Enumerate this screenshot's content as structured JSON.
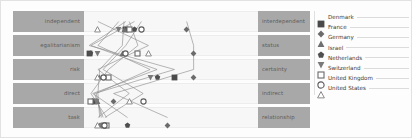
{
  "chart_data": {
    "type": "line",
    "title": "",
    "subtitle": "",
    "xlabel": "",
    "ylabel": "",
    "grid": true,
    "legend_position": "right",
    "xlim": [
      0,
      100
    ],
    "dimensions": [
      {
        "left": "independent",
        "right": "interdependent"
      },
      {
        "left": "egalitarianism",
        "right": "status"
      },
      {
        "left": "risk",
        "right": "certainty"
      },
      {
        "left": "direct",
        "right": "indirect"
      },
      {
        "left": "task",
        "right": "relationship"
      }
    ],
    "categories": [
      "independent",
      "egalitarianism",
      "risk",
      "direct",
      "task"
    ],
    "series": [
      {
        "name": "Denmark",
        "marker": "filled-square",
        "color": "#4a4a4a",
        "values": [
          24,
          3,
          52,
          6,
          11
        ]
      },
      {
        "name": "France",
        "marker": "filled-diamond",
        "color": "#6b6b6b",
        "values": [
          59,
          63,
          63,
          17,
          48
        ]
      },
      {
        "name": "Germany",
        "marker": "filled-triangle",
        "color": "#6f6f6f",
        "values": [
          23,
          22,
          9,
          8,
          9
        ]
      },
      {
        "name": "Israel",
        "marker": "filled-pentagon",
        "color": "#4f4f4f",
        "values": [
          29,
          4,
          42,
          5,
          25
        ]
      },
      {
        "name": "Netherlands",
        "marker": "filled-downtri",
        "color": "#7a7a7a",
        "values": [
          20,
          8,
          38,
          7,
          10
        ]
      },
      {
        "name": "Switzerland",
        "marker": "open-square",
        "color": "#6a6a6a",
        "values": [
          26,
          31,
          14,
          4,
          13
        ]
      },
      {
        "name": "United Kingdom",
        "marker": "open-circle",
        "color": "#5a5a5a",
        "values": [
          33,
          24,
          11,
          34,
          12
        ]
      },
      {
        "name": "United States",
        "marker": "open-triangle",
        "color": "#8a8a8a",
        "values": [
          8,
          37,
          8,
          26,
          8
        ]
      }
    ],
    "axis_band_color": "#a8a8a8",
    "plot_band_color": "#f7f7f7",
    "line_color": "#8d8d8d"
  },
  "legend": {
    "items": [
      {
        "label": "Denmark"
      },
      {
        "label": "France"
      },
      {
        "label": "Germany"
      },
      {
        "label": "Israel"
      },
      {
        "label": "Netherlands"
      },
      {
        "label": "Switzerland"
      },
      {
        "label": "United Kingdom"
      },
      {
        "label": "United States"
      }
    ]
  }
}
